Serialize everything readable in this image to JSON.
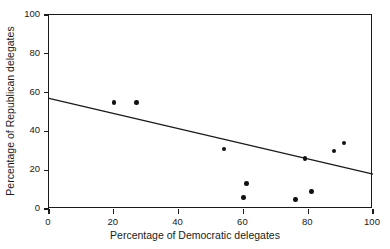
{
  "chart_data": {
    "type": "scatter",
    "title": "",
    "xlabel": "Percentage of Democratic delegates",
    "ylabel": "Percentage of Republican delegates",
    "xlim": [
      0,
      100
    ],
    "ylim": [
      0,
      100
    ],
    "xticks": [
      0,
      20,
      40,
      60,
      80,
      100
    ],
    "yticks": [
      0,
      20,
      40,
      60,
      80,
      100
    ],
    "xtick_labels": [
      "0",
      "20",
      "40",
      "60",
      "80",
      "100"
    ],
    "ytick_labels": [
      "0",
      "20",
      "40",
      "60",
      "80",
      "100"
    ],
    "grid": false,
    "legend": false,
    "marker": "filled-circle",
    "marker_color": "#111111",
    "frame_color": "#1a1a1a",
    "background_color": "#ffffff",
    "points": [
      {
        "x": 20,
        "y": 55
      },
      {
        "x": 27,
        "y": 55
      },
      {
        "x": 54,
        "y": 31
      },
      {
        "x": 60,
        "y": 6
      },
      {
        "x": 61,
        "y": 13
      },
      {
        "x": 76,
        "y": 5
      },
      {
        "x": 79,
        "y": 26
      },
      {
        "x": 81,
        "y": 9
      },
      {
        "x": 88,
        "y": 30
      },
      {
        "x": 91,
        "y": 34
      }
    ],
    "trendline": {
      "type": "linear",
      "color": "#1a1a1a",
      "x_start": 0,
      "y_start": 57,
      "x_end": 100,
      "y_end": 18
    }
  }
}
